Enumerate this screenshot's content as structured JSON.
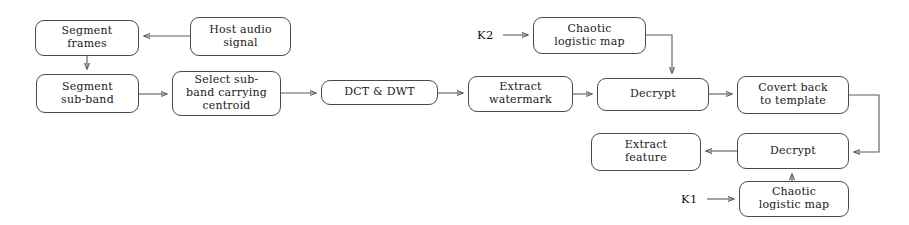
{
  "diagram": {
    "background_color": "#ffffff",
    "line_color": "#5a5a5a",
    "box_border_color": "#4a4a4a",
    "text_color": "#1a1a1a",
    "nodes": [
      {
        "id": "segment_frames",
        "label": "Segment\nframes",
        "x": 35,
        "y": 20,
        "w": 104,
        "h": 36
      },
      {
        "id": "host_audio",
        "label": "Host audio\nsignal",
        "x": 190,
        "y": 17,
        "w": 101,
        "h": 39
      },
      {
        "id": "segment_subband",
        "label": "Segment\nsub-band",
        "x": 36,
        "y": 74,
        "w": 103,
        "h": 39
      },
      {
        "id": "select_subband",
        "label": "Select sub-\nband carrying\ncentroid",
        "x": 172,
        "y": 71,
        "w": 109,
        "h": 45
      },
      {
        "id": "dct_dwt",
        "label": "DCT & DWT",
        "x": 321,
        "y": 80,
        "w": 117,
        "h": 25
      },
      {
        "id": "extract_watermark",
        "label": "Extract\nwatermark",
        "x": 468,
        "y": 76,
        "w": 105,
        "h": 36
      },
      {
        "id": "chaotic_map_top",
        "label": "Chaotic\nlogistic map",
        "x": 533,
        "y": 17,
        "w": 113,
        "h": 37
      },
      {
        "id": "decrypt_top",
        "label": "Decrypt",
        "x": 597,
        "y": 78,
        "w": 112,
        "h": 33
      },
      {
        "id": "covert_back",
        "label": "Covert back\nto template",
        "x": 737,
        "y": 76,
        "w": 112,
        "h": 38
      },
      {
        "id": "extract_feature",
        "label": "Extract\nfeature",
        "x": 591,
        "y": 133,
        "w": 110,
        "h": 38
      },
      {
        "id": "decrypt_bottom",
        "label": "Decrypt",
        "x": 737,
        "y": 133,
        "w": 112,
        "h": 36
      },
      {
        "id": "chaotic_map_bottom",
        "label": "Chaotic\nlogistic map",
        "x": 739,
        "y": 181,
        "w": 110,
        "h": 36
      }
    ],
    "key_labels": [
      {
        "id": "k2",
        "text": "K2",
        "x": 477,
        "y": 28
      },
      {
        "id": "k1",
        "text": "K1",
        "x": 681,
        "y": 192
      }
    ],
    "connections": [
      {
        "from": "host_audio",
        "to": "segment_frames",
        "style": "straight-left"
      },
      {
        "from": "segment_frames",
        "to": "segment_subband",
        "style": "straight-down"
      },
      {
        "from": "segment_subband",
        "to": "select_subband",
        "style": "straight-right"
      },
      {
        "from": "select_subband",
        "to": "dct_dwt",
        "style": "straight-right"
      },
      {
        "from": "dct_dwt",
        "to": "extract_watermark",
        "style": "straight-right"
      },
      {
        "from": "extract_watermark",
        "to": "decrypt_top",
        "style": "straight-right"
      },
      {
        "from": "k2",
        "to": "chaotic_map_top",
        "style": "straight-right"
      },
      {
        "from": "chaotic_map_top",
        "to": "decrypt_top",
        "style": "elbow-right-down"
      },
      {
        "from": "decrypt_top",
        "to": "covert_back",
        "style": "straight-right"
      },
      {
        "from": "covert_back",
        "to": "decrypt_bottom",
        "style": "elbow-right-down-left"
      },
      {
        "from": "decrypt_bottom",
        "to": "extract_feature",
        "style": "straight-left"
      },
      {
        "from": "k1",
        "to": "chaotic_map_bottom",
        "style": "straight-right"
      },
      {
        "from": "chaotic_map_bottom",
        "to": "decrypt_bottom",
        "style": "straight-up"
      }
    ]
  }
}
